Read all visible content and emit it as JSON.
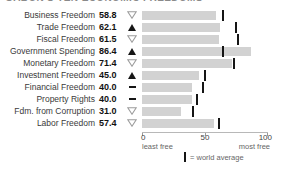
{
  "title": "GABON'S TEN ECONOMIC FREEDOMS",
  "chart_data": {
    "type": "bar",
    "orientation": "horizontal",
    "xlim": [
      0,
      100
    ],
    "x_ticks": [
      "0",
      "50",
      "100"
    ],
    "axis_left_caption": "least free",
    "axis_right_caption": "most free",
    "legend_label": "= world average",
    "bar_color": "#d2d2d2",
    "world_average_tick_color": "#151515",
    "categories": [
      "Business Freedom",
      "Trade Freedom",
      "Fiscal Freedom",
      "Government Spending",
      "Monetary Freedom",
      "Investment Freedom",
      "Financial Freedom",
      "Property Rights",
      "Fdm. from Corruption",
      "Labor Freedom"
    ],
    "series": [
      {
        "name": "score",
        "values": [
          58.8,
          62.1,
          61.5,
          86.4,
          71.4,
          45.0,
          40.0,
          40.0,
          31.0,
          57.4
        ]
      },
      {
        "name": "world average",
        "values": [
          64.3,
          74.8,
          76.3,
          63.9,
          73.4,
          50.2,
          48.5,
          43.6,
          40.5,
          61.5
        ]
      }
    ],
    "rows": [
      {
        "label": "Business Freedom",
        "value": "58.8",
        "score": 58.8,
        "trend": "down",
        "world_average": 64.3
      },
      {
        "label": "Trade Freedom",
        "value": "62.1",
        "score": 62.1,
        "trend": "up",
        "world_average": 74.8
      },
      {
        "label": "Fiscal Freedom",
        "value": "61.5",
        "score": 61.5,
        "trend": "down",
        "world_average": 76.3
      },
      {
        "label": "Government Spending",
        "value": "86.4",
        "score": 86.4,
        "trend": "up",
        "world_average": 63.9
      },
      {
        "label": "Monetary Freedom",
        "value": "71.4",
        "score": 71.4,
        "trend": "down",
        "world_average": 73.4
      },
      {
        "label": "Investment Freedom",
        "value": "45.0",
        "score": 45.0,
        "trend": "up",
        "world_average": 50.2
      },
      {
        "label": "Financial Freedom",
        "value": "40.0",
        "score": 40.0,
        "trend": "none",
        "world_average": 48.5
      },
      {
        "label": "Property Rights",
        "value": "40.0",
        "score": 40.0,
        "trend": "none",
        "world_average": 43.6
      },
      {
        "label": "Fdm. from Corruption",
        "value": "31.0",
        "score": 31.0,
        "trend": "down",
        "world_average": 40.5
      },
      {
        "label": "Labor Freedom",
        "value": "57.4",
        "score": 57.4,
        "trend": "down",
        "world_average": 61.5
      }
    ]
  }
}
